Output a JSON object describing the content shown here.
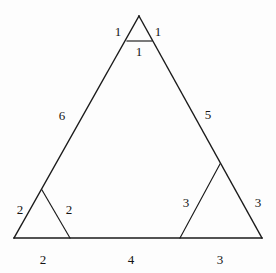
{
  "figure": {
    "background_color": "#fdfdfd",
    "stroke_color": "#1a1a1a",
    "text_color": "#141414",
    "main_triangle": {
      "name": "main-triangle",
      "apex": [
        139,
        16
      ],
      "bottom_left": [
        14,
        238
      ],
      "bottom_right": [
        262,
        238
      ],
      "left_side_label": "6",
      "right_side_label": "5"
    },
    "labels": [
      {
        "id": "apex-left",
        "text": "1",
        "x": 118,
        "y": 31
      },
      {
        "id": "apex-right",
        "text": "1",
        "x": 158,
        "y": 31
      },
      {
        "id": "apex-base",
        "text": "1",
        "x": 139,
        "y": 51
      },
      {
        "id": "left-side-main",
        "text": "6",
        "x": 62,
        "y": 115
      },
      {
        "id": "right-side-main",
        "text": "5",
        "x": 208,
        "y": 114
      },
      {
        "id": "bl-left",
        "text": "2",
        "x": 20,
        "y": 209
      },
      {
        "id": "bl-right",
        "text": "2",
        "x": 69,
        "y": 209
      },
      {
        "id": "br-left",
        "text": "3",
        "x": 186,
        "y": 202
      },
      {
        "id": "br-right",
        "text": "3",
        "x": 258,
        "y": 202
      },
      {
        "id": "base-left",
        "text": "2",
        "x": 43,
        "y": 259
      },
      {
        "id": "base-middle",
        "text": "4",
        "x": 131,
        "y": 259
      },
      {
        "id": "base-right",
        "text": "3",
        "x": 220,
        "y": 259
      }
    ],
    "sub_triangles": [
      {
        "id": "apex-sub-triangle",
        "name": "apex-small-triangle",
        "vertices": [
          [
            139,
            16
          ],
          [
            127,
            41
          ],
          [
            152,
            41
          ]
        ],
        "side_labels": [
          "1",
          "1",
          "1"
        ]
      },
      {
        "id": "bottom-left-sub-triangle",
        "name": "bottom-left-small-triangle",
        "vertices": [
          [
            42,
            190
          ],
          [
            14,
            238
          ],
          [
            70,
            238
          ]
        ],
        "side_labels": [
          "2",
          "2",
          "2"
        ]
      },
      {
        "id": "bottom-right-sub-triangle",
        "name": "bottom-right-small-triangle",
        "vertices": [
          [
            220,
            164
          ],
          [
            180,
            238
          ],
          [
            262,
            238
          ]
        ],
        "side_labels": [
          "3",
          "3",
          "3"
        ]
      }
    ],
    "segments": [
      {
        "id": "main-left-edge",
        "from": [
          139,
          16
        ],
        "to": [
          14,
          238
        ]
      },
      {
        "id": "main-right-edge",
        "from": [
          139,
          16
        ],
        "to": [
          262,
          238
        ]
      },
      {
        "id": "main-base-edge",
        "from": [
          14,
          238
        ],
        "to": [
          262,
          238
        ]
      },
      {
        "id": "apex-sub-base",
        "from": [
          127,
          41
        ],
        "to": [
          152,
          41
        ]
      },
      {
        "id": "bottom-left-sub-right-edge",
        "from": [
          42,
          190
        ],
        "to": [
          70,
          238
        ]
      },
      {
        "id": "bottom-right-sub-left-edge",
        "from": [
          220,
          164
        ],
        "to": [
          180,
          238
        ]
      }
    ]
  }
}
